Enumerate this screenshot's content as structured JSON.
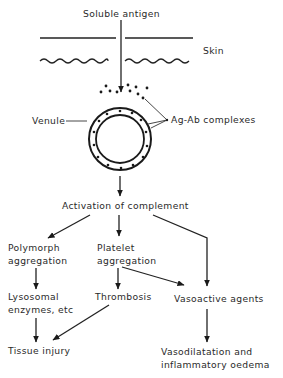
{
  "diagram": {
    "type": "flowchart",
    "nodes": {
      "antigen": "Soluble antigen",
      "skin": "Skin",
      "venule": "Venule",
      "complexes": "Ag-Ab complexes",
      "complement": "Activation of complement",
      "polymorph_1": "Polymorph",
      "polymorph_2": "aggregation",
      "platelet_1": "Platelet",
      "platelet_2": "aggregation",
      "lysosomal_1": "Lysosomal",
      "lysosomal_2": "enzymes, etc",
      "thrombosis": "Thrombosis",
      "vasoactive": "Vasoactive agents",
      "tissue": "Tissue injury",
      "vasodilatation_1": "Vasodilatation and",
      "vasodilatation_2": "inflammatory oedema"
    },
    "edges": [
      [
        "Soluble antigen",
        "Ag-Ab complexes"
      ],
      [
        "Ag-Ab complexes",
        "Activation of complement"
      ],
      [
        "Activation of complement",
        "Polymorph aggregation"
      ],
      [
        "Activation of complement",
        "Platelet aggregation"
      ],
      [
        "Activation of complement",
        "Vasoactive agents"
      ],
      [
        "Polymorph aggregation",
        "Lysosomal enzymes, etc"
      ],
      [
        "Platelet aggregation",
        "Thrombosis"
      ],
      [
        "Platelet aggregation",
        "Vasoactive agents"
      ],
      [
        "Lysosomal enzymes, etc",
        "Tissue injury"
      ],
      [
        "Thrombosis",
        "Tissue injury"
      ],
      [
        "Vasoactive agents",
        "Vasodilatation and inflammatory oedema"
      ]
    ]
  }
}
